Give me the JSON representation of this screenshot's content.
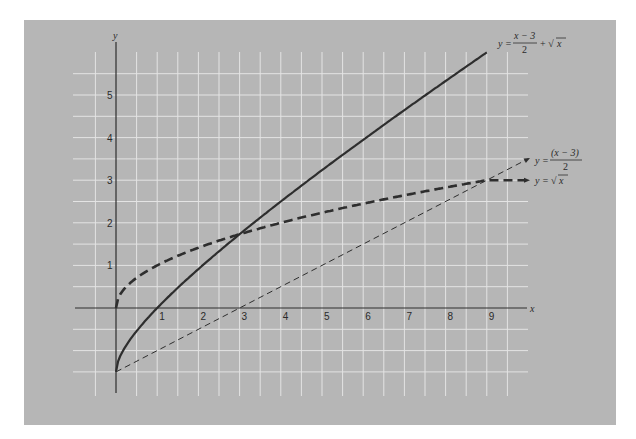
{
  "chart_data": {
    "type": "line",
    "title": "",
    "xlabel": "x",
    "ylabel": "y",
    "xlim": [
      -1,
      10
    ],
    "ylim": [
      -2,
      6.2
    ],
    "grid": true,
    "grid_step": 0.5,
    "x_ticks": [
      1,
      2,
      3,
      4,
      5,
      6,
      7,
      8,
      9
    ],
    "y_ticks": [
      1,
      2,
      3,
      4,
      5
    ],
    "series": [
      {
        "name": "y = (x − 3)/2 + √x",
        "style": "solid-thick",
        "x": [
          0,
          0.25,
          0.5,
          1,
          1.5,
          2,
          3,
          4,
          5,
          6,
          7,
          8,
          9
        ],
        "values": [
          -1.5,
          -0.875,
          -0.543,
          0,
          0.475,
          0.914,
          1.732,
          2.5,
          3.236,
          3.949,
          4.646,
          5.328,
          6.0
        ]
      },
      {
        "name": "y = √x",
        "style": "dashed-thick",
        "x": [
          0,
          0.25,
          0.5,
          1,
          2,
          3,
          4,
          5,
          6,
          7,
          8,
          9,
          10
        ],
        "values": [
          0,
          0.5,
          0.707,
          1,
          1.414,
          1.732,
          2,
          2.236,
          2.449,
          2.646,
          2.828,
          3.0,
          3.0
        ]
      },
      {
        "name": "y = (x − 3)/2",
        "style": "dashed-thin",
        "x": [
          0,
          3,
          9,
          10
        ],
        "values": [
          -1.5,
          0,
          3.0,
          3.5
        ]
      }
    ],
    "annotations": [
      {
        "text": "y = (x − 3)/2 + √x",
        "at": [
          9.2,
          6.1
        ]
      },
      {
        "text": "y = (x − 3)/2",
        "at": [
          10.2,
          3.5
        ]
      },
      {
        "text": "y = √x",
        "at": [
          10.2,
          3.0
        ]
      }
    ]
  },
  "labels": {
    "x_axis": "x",
    "y_axis": "y",
    "eq1": {
      "lhs": "y =",
      "num": "x − 3",
      "den": "2",
      "tail": "+ √",
      "rad": "x"
    },
    "eq2": {
      "lhs": "y =",
      "num": "(x − 3)",
      "den": "2"
    },
    "eq3": {
      "lhs": "y =",
      "root": "√",
      "rad": "x"
    }
  },
  "colors": {
    "background": "#b6b6b6",
    "grid": "#e4e4e4",
    "ink": "#2e2e2e"
  }
}
